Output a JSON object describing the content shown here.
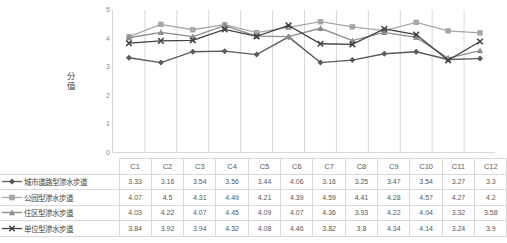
{
  "chart_data": {
    "type": "line",
    "title": "",
    "xlabel": "",
    "ylabel": "分值",
    "ylim": [
      0,
      5
    ],
    "yticks": [
      5,
      4,
      3,
      2,
      1,
      0
    ],
    "grid": "vertical",
    "legend_position": "table-below",
    "categories": [
      "C1",
      "C2",
      "C3",
      "C4",
      "C5",
      "C6",
      "C7",
      "C8",
      "C9",
      "C10",
      "C11",
      "C12"
    ],
    "series": [
      {
        "name": "城市道路型渗水步道",
        "marker": "diamond",
        "color": "#595959",
        "values": [
          3.33,
          3.16,
          3.54,
          3.56,
          3.44,
          4.06,
          3.16,
          3.25,
          3.47,
          3.54,
          3.27,
          3.3
        ]
      },
      {
        "name": "公园型渗水步道",
        "marker": "square",
        "color": "#a6a6a6",
        "values": [
          4.07,
          4.5,
          4.31,
          4.49,
          4.21,
          4.39,
          4.59,
          4.41,
          4.28,
          4.57,
          4.27,
          4.2
        ]
      },
      {
        "name": "住区型渗水步道",
        "marker": "triangle",
        "color": "#8c8c8c",
        "values": [
          4.03,
          4.22,
          4.07,
          4.45,
          4.09,
          4.07,
          4.36,
          3.93,
          4.22,
          4.04,
          3.32,
          3.58
        ]
      },
      {
        "name": "单位型渗水步道",
        "marker": "cross",
        "color": "#404040",
        "values": [
          3.84,
          3.92,
          3.94,
          4.32,
          4.08,
          4.46,
          3.82,
          3.8,
          4.34,
          4.14,
          3.24,
          3.9
        ]
      }
    ]
  },
  "table": {
    "corner_label": "",
    "header": [
      "C1",
      "C2",
      "C3",
      "C4",
      "C5",
      "C6",
      "C7",
      "C8",
      "C9",
      "C10",
      "C11",
      "C12"
    ],
    "rows": [
      {
        "label": "城市道路型渗水步道",
        "cells": [
          "3.33",
          "3.16",
          "3.54",
          "3.56",
          "3.44",
          "4.06",
          "3.16",
          "3.25",
          "3.47",
          "3.54",
          "3.27",
          "3.3"
        ]
      },
      {
        "label": "公园型渗水步道",
        "cells": [
          "4.07",
          "4.5",
          "4.31",
          "4.49",
          "4.21",
          "4.39",
          "4.59",
          "4.41",
          "4.28",
          "4.57",
          "4.27",
          "4.2"
        ]
      },
      {
        "label": "住区型渗水步道",
        "cells": [
          "4.03",
          "4.22",
          "4.07",
          "4.45",
          "4.09",
          "4.07",
          "4.36",
          "3.93",
          "4.22",
          "4.04",
          "3.32",
          "3.58"
        ]
      },
      {
        "label": "单位型渗水步道",
        "cells": [
          "3.84",
          "3.92",
          "3.94",
          "4.32",
          "4.08",
          "4.46",
          "3.82",
          "3.8",
          "4.34",
          "4.14",
          "3.24",
          "3.9"
        ]
      }
    ]
  },
  "colors": {
    "grid": "#d7d7d7",
    "axis": "#c9c9c9",
    "border": "#d9d9d9",
    "text": "#595959"
  }
}
